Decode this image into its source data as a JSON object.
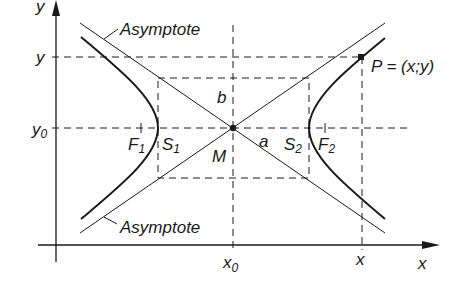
{
  "diagram": {
    "colors": {
      "ink": "#1a1a1a",
      "background": "#ffffff"
    },
    "axes": {
      "x_label": "x",
      "y_label": "y"
    },
    "ticks": {
      "x0": "x",
      "x0_sub": "0",
      "x": "x",
      "y0": "y",
      "y0_sub": "0",
      "y": "y"
    },
    "labels": {
      "asymptote_top": "Asymptote",
      "asymptote_bottom": "Asymptote",
      "point_p": "P = (x;y)",
      "b": "b",
      "a": "a",
      "m": "M",
      "f1": "F",
      "f1_sub": "1",
      "s1": "S",
      "s1_sub": "1",
      "s2": "S",
      "s2_sub": "2",
      "f2": "F",
      "f2_sub": "2"
    }
  }
}
